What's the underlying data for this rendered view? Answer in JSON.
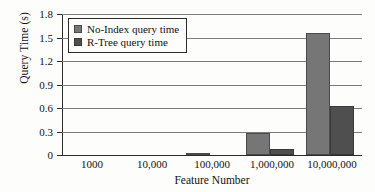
{
  "chart_data": {
    "type": "bar",
    "title": "",
    "xlabel": "Feature Number",
    "ylabel": "Query Time (s)",
    "categories": [
      "1000",
      "10,000",
      "100,000",
      "1,000,000",
      "10,000,000"
    ],
    "series": [
      {
        "name": "No-Index query time",
        "color": "#767676",
        "values": [
          0,
          0,
          0.02,
          0.28,
          1.56
        ]
      },
      {
        "name": "R-Tree query time",
        "color": "#4f4f4f",
        "values": [
          0,
          0,
          0.005,
          0.08,
          0.62
        ]
      }
    ],
    "ylim": [
      0,
      1.8
    ],
    "ytick_labels": [
      "0",
      "0.3",
      "0.6",
      "0.9",
      "1.2",
      "1.5",
      "1.8"
    ],
    "ytick_values": [
      0,
      0.3,
      0.6,
      0.9,
      1.2,
      1.5,
      1.8
    ],
    "grid": true,
    "legend_position": "upper-left"
  }
}
